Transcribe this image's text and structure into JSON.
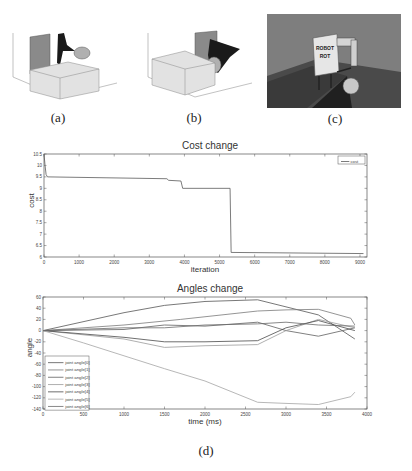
{
  "figure": {
    "subfigures": [
      {
        "id": "a",
        "caption": "(a)",
        "description": "3D simulation plot: robot arm near box and sphere"
      },
      {
        "id": "b",
        "caption": "(b)",
        "description": "3D simulation plot: robot arm reaching sphere behind box"
      },
      {
        "id": "c",
        "caption": "(c)",
        "description": "Rendered simulation of robot on table with sphere",
        "robot_label_line1": "ROBOT",
        "robot_label_line2": "ROT"
      },
      {
        "id": "d",
        "caption": "(d)",
        "description": "Cost change and angles change plots"
      }
    ]
  },
  "chart_data": [
    {
      "type": "line",
      "title": "Cost change",
      "xlabel": "iteration",
      "ylabel": "cost",
      "xlim": [
        0,
        9200
      ],
      "ylim": [
        6,
        10.5
      ],
      "xticks": [
        0,
        1000,
        2000,
        3000,
        4000,
        5000,
        6000,
        7000,
        8000,
        9000
      ],
      "yticks": [
        6,
        6.5,
        7,
        7.5,
        8,
        8.5,
        9,
        9.5,
        10,
        10.5
      ],
      "legend": {
        "position": "upper right",
        "entries": [
          "cost"
        ]
      },
      "grid": false,
      "series": [
        {
          "name": "cost",
          "color": "#5a5a5a",
          "x": [
            0,
            30,
            60,
            100,
            3500,
            3550,
            3900,
            3950,
            5300,
            5330,
            9100
          ],
          "y": [
            10.5,
            10.0,
            9.6,
            9.5,
            9.42,
            9.35,
            9.32,
            9.0,
            9.0,
            6.2,
            6.15
          ]
        }
      ]
    },
    {
      "type": "line",
      "title": "Angles change",
      "xlabel": "time (ms)",
      "ylabel": "angle",
      "xlim": [
        0,
        4000
      ],
      "ylim": [
        -140,
        60
      ],
      "xticks": [
        0,
        500,
        1000,
        1500,
        2000,
        2500,
        3000,
        3500,
        4000
      ],
      "yticks": [
        -140,
        -120,
        -100,
        -80,
        -60,
        -40,
        -20,
        0,
        20,
        40,
        60
      ],
      "legend": {
        "position": "lower left",
        "entries": [
          "joint angle[0]",
          "joint angle[1]",
          "joint angle[2]",
          "joint angle[3]",
          "joint angle[4]",
          "joint angle[5]",
          "joint angle[6]"
        ]
      },
      "grid": false,
      "series": [
        {
          "name": "joint angle[0]",
          "color": "#555555",
          "x": [
            0,
            1000,
            1500,
            2000,
            2650,
            3400,
            3850
          ],
          "y": [
            0,
            32,
            45,
            52,
            55,
            28,
            -15
          ]
        },
        {
          "name": "joint angle[1]",
          "color": "#7a7a7a",
          "x": [
            0,
            1000,
            1700,
            2650,
            3000,
            3400,
            3800,
            3850
          ],
          "y": [
            0,
            10,
            20,
            35,
            37,
            38,
            22,
            10
          ]
        },
        {
          "name": "joint angle[2]",
          "color": "#606060",
          "x": [
            0,
            1000,
            1500,
            2000,
            2650,
            3000,
            3400,
            3850
          ],
          "y": [
            0,
            2,
            10,
            8,
            15,
            0,
            -10,
            5
          ]
        },
        {
          "name": "joint angle[3]",
          "color": "#9a9a9a",
          "x": [
            0,
            1000,
            1500,
            2000,
            2650,
            3000,
            3400,
            3850
          ],
          "y": [
            0,
            -15,
            -30,
            -27,
            -25,
            0,
            20,
            5
          ]
        },
        {
          "name": "joint angle[4]",
          "color": "#4a4a4a",
          "x": [
            0,
            1000,
            1500,
            2000,
            2650,
            3000,
            3400,
            3850
          ],
          "y": [
            0,
            -12,
            -20,
            -20,
            -18,
            5,
            18,
            0
          ]
        },
        {
          "name": "joint angle[5]",
          "color": "#a5a5a5",
          "x": [
            0,
            500,
            1000,
            1500,
            2000,
            2650,
            3000,
            3400,
            3800,
            3850
          ],
          "y": [
            0,
            -22,
            -45,
            -68,
            -90,
            -128,
            -130,
            -132,
            -118,
            -110
          ]
        },
        {
          "name": "joint angle[6]",
          "color": "#6a6a6a",
          "x": [
            0,
            1000,
            1500,
            2000,
            2650,
            3000,
            3400,
            3850
          ],
          "y": [
            0,
            5,
            5,
            10,
            12,
            15,
            10,
            8
          ]
        }
      ]
    }
  ]
}
